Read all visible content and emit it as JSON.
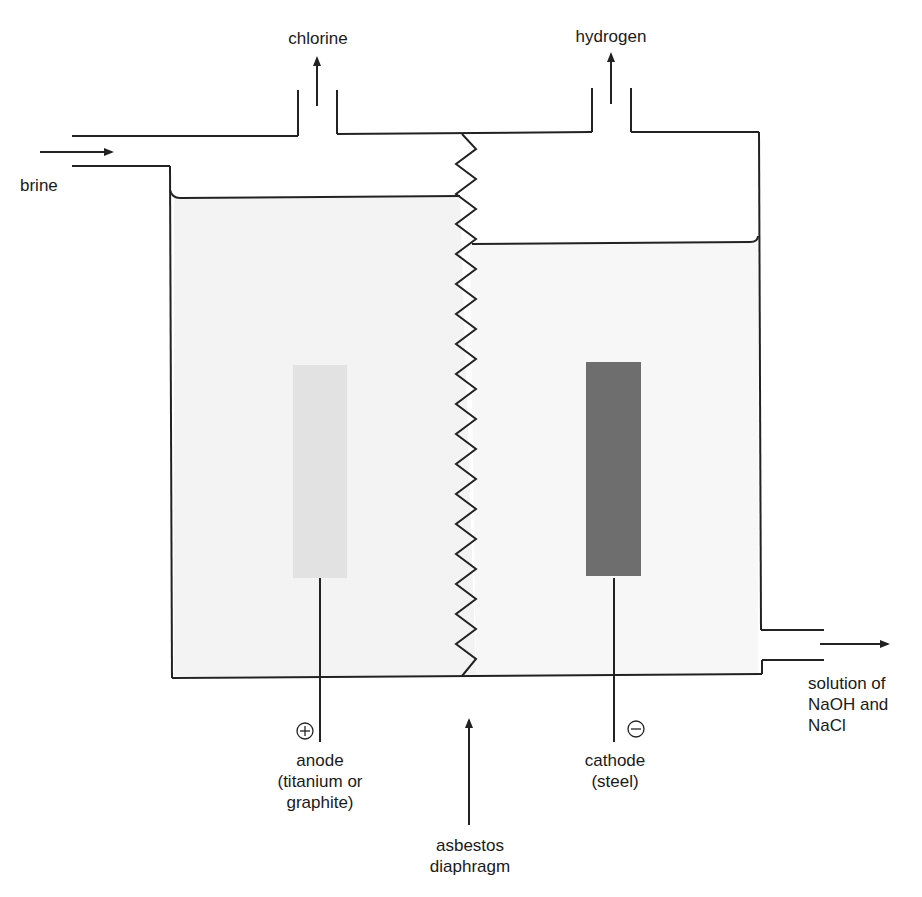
{
  "diagram": {
    "colors": {
      "line": "#222222",
      "liquid_left": "#f3f3f3",
      "liquid_right": "#f7f7f7",
      "anode": "#e2e2e2",
      "cathode": "#6e6e6e"
    }
  },
  "labels": {
    "chlorine": "chlorine",
    "hydrogen": "hydrogen",
    "brine": "brine",
    "outlet": "solution of\nNaOH and\nNaCl",
    "anode": "anode\n(titanium or\ngraphite)",
    "cathode": "cathode\n(steel)",
    "diaphragm": "asbestos\ndiaphragm",
    "anode_sign": "+",
    "cathode_sign": "−"
  },
  "components": [
    {
      "id": "anode",
      "label": "anode (titanium or graphite)",
      "polarity": "positive",
      "compartment": "left"
    },
    {
      "id": "cathode",
      "label": "cathode (steel)",
      "polarity": "negative",
      "compartment": "right"
    },
    {
      "id": "diaphragm",
      "label": "asbestos diaphragm",
      "position": "center"
    }
  ],
  "flows": [
    {
      "name": "brine",
      "direction": "in",
      "side": "left"
    },
    {
      "name": "chlorine",
      "direction": "out",
      "side": "top-left"
    },
    {
      "name": "hydrogen",
      "direction": "out",
      "side": "top-right"
    },
    {
      "name": "solution of NaOH and NaCl",
      "direction": "out",
      "side": "bottom-right"
    }
  ]
}
